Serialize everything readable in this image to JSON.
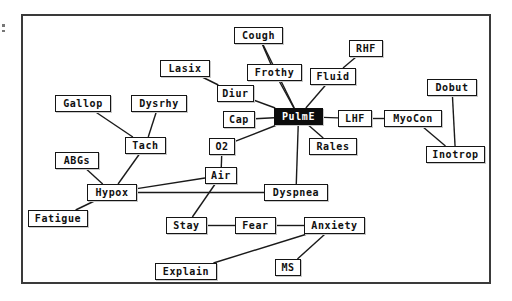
{
  "diagram": {
    "type": "concept-map",
    "canvas": {
      "width": 512,
      "height": 301
    },
    "frame": {
      "x": 21,
      "y": 14,
      "width": 470,
      "height": 270,
      "border_color": "#3a3a3a"
    },
    "style": {
      "node_fill": "#ffffff",
      "node_border": "#151515",
      "node_text": "#101010",
      "selected_fill": "#0c0c0c",
      "selected_text": "#ffffff",
      "edge_color": "#1a1a1a",
      "background": "#ffffff"
    },
    "nodes": [
      {
        "id": "cough",
        "label": "Cough",
        "x": 234,
        "y": 27,
        "w": 49,
        "selected": false
      },
      {
        "id": "rhf",
        "label": "RHF",
        "x": 349,
        "y": 40,
        "w": 34,
        "selected": false
      },
      {
        "id": "lasix",
        "label": "Lasix",
        "x": 160,
        "y": 60,
        "w": 50,
        "selected": false
      },
      {
        "id": "frothy",
        "label": "Frothy",
        "x": 247,
        "y": 64,
        "w": 55,
        "selected": false
      },
      {
        "id": "fluid",
        "label": "Fluid",
        "x": 310,
        "y": 68,
        "w": 46,
        "selected": false
      },
      {
        "id": "dobut",
        "label": "Dobut",
        "x": 427,
        "y": 79,
        "w": 50,
        "selected": false
      },
      {
        "id": "diur",
        "label": "Diur",
        "x": 217,
        "y": 85,
        "w": 37,
        "selected": false
      },
      {
        "id": "gallop",
        "label": "Gallop",
        "x": 55,
        "y": 95,
        "w": 56,
        "selected": false
      },
      {
        "id": "dysrhy",
        "label": "Dysrhy",
        "x": 131,
        "y": 95,
        "w": 56,
        "selected": false
      },
      {
        "id": "cap",
        "label": "Cap",
        "x": 223,
        "y": 111,
        "w": 32,
        "selected": false
      },
      {
        "id": "pulme",
        "label": "PulmE",
        "x": 274,
        "y": 108,
        "w": 49,
        "selected": true
      },
      {
        "id": "lhf",
        "label": "LHF",
        "x": 338,
        "y": 110,
        "w": 34,
        "selected": false
      },
      {
        "id": "myocon",
        "label": "MyoCon",
        "x": 384,
        "y": 110,
        "w": 58,
        "selected": false
      },
      {
        "id": "tach",
        "label": "Tach",
        "x": 125,
        "y": 137,
        "w": 41,
        "selected": false
      },
      {
        "id": "o2",
        "label": "O2",
        "x": 209,
        "y": 138,
        "w": 26,
        "selected": false
      },
      {
        "id": "rales",
        "label": "Rales",
        "x": 309,
        "y": 138,
        "w": 48,
        "selected": false
      },
      {
        "id": "inotrop",
        "label": "Inotrop",
        "x": 426,
        "y": 146,
        "w": 59,
        "selected": false
      },
      {
        "id": "abgs",
        "label": "ABGs",
        "x": 55,
        "y": 152,
        "w": 44,
        "selected": false
      },
      {
        "id": "air",
        "label": "Air",
        "x": 205,
        "y": 167,
        "w": 32,
        "selected": false
      },
      {
        "id": "hypox",
        "label": "Hypox",
        "x": 87,
        "y": 184,
        "w": 50,
        "selected": false
      },
      {
        "id": "dyspnea",
        "label": "Dyspnea",
        "x": 264,
        "y": 184,
        "w": 64,
        "selected": false
      },
      {
        "id": "fatigue",
        "label": "Fatigue",
        "x": 28,
        "y": 210,
        "w": 60,
        "selected": false
      },
      {
        "id": "stay",
        "label": "Stay",
        "x": 166,
        "y": 217,
        "w": 41,
        "selected": false
      },
      {
        "id": "fear",
        "label": "Fear",
        "x": 235,
        "y": 217,
        "w": 41,
        "selected": false
      },
      {
        "id": "anxiety",
        "label": "Anxiety",
        "x": 304,
        "y": 217,
        "w": 61,
        "selected": false
      },
      {
        "id": "ms",
        "label": "MS",
        "x": 275,
        "y": 259,
        "w": 26,
        "selected": false
      },
      {
        "id": "explain",
        "label": "Explain",
        "x": 155,
        "y": 263,
        "w": 62,
        "selected": false
      }
    ],
    "edges": [
      {
        "from": "cough",
        "to": "frothy"
      },
      {
        "from": "cough",
        "to": "pulme"
      },
      {
        "from": "rhf",
        "to": "fluid"
      },
      {
        "from": "lasix",
        "to": "diur"
      },
      {
        "from": "frothy",
        "to": "pulme"
      },
      {
        "from": "fluid",
        "to": "pulme"
      },
      {
        "from": "diur",
        "to": "pulme"
      },
      {
        "from": "gallop",
        "to": "tach"
      },
      {
        "from": "dysrhy",
        "to": "tach"
      },
      {
        "from": "cap",
        "to": "pulme"
      },
      {
        "from": "pulme",
        "to": "lhf"
      },
      {
        "from": "lhf",
        "to": "myocon"
      },
      {
        "from": "myocon",
        "to": "inotrop"
      },
      {
        "from": "dobut",
        "to": "inotrop"
      },
      {
        "from": "pulme",
        "to": "o2"
      },
      {
        "from": "pulme",
        "to": "rales"
      },
      {
        "from": "pulme",
        "to": "dyspnea"
      },
      {
        "from": "tach",
        "to": "hypox"
      },
      {
        "from": "abgs",
        "to": "hypox"
      },
      {
        "from": "o2",
        "to": "air"
      },
      {
        "from": "air",
        "to": "hypox"
      },
      {
        "from": "air",
        "to": "stay"
      },
      {
        "from": "hypox",
        "to": "dyspnea"
      },
      {
        "from": "hypox",
        "to": "fatigue"
      },
      {
        "from": "stay",
        "to": "fear"
      },
      {
        "from": "fear",
        "to": "anxiety"
      },
      {
        "from": "anxiety",
        "to": "explain"
      },
      {
        "from": "anxiety",
        "to": "ms"
      }
    ]
  }
}
